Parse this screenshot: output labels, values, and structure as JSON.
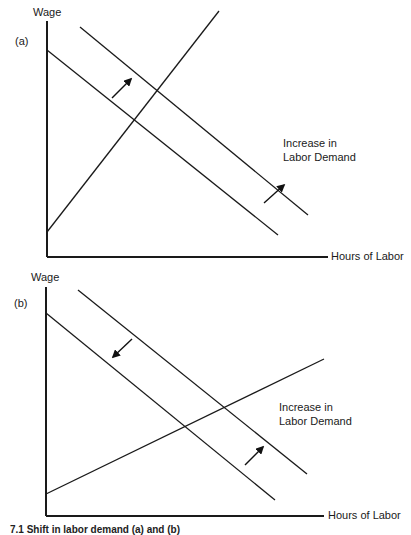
{
  "panels": [
    {
      "id": "a",
      "label": "(a)",
      "y_axis_label": "Wage",
      "x_axis_label": "Hours of Labor",
      "annotation": [
        "Increase in",
        "Labor Demand"
      ],
      "lines": {
        "y_axis": [
          47,
          21,
          47,
          257
        ],
        "x_axis": [
          47,
          257,
          328,
          257
        ],
        "demand_original": [
          47,
          50,
          278,
          235
        ],
        "demand_shifted": [
          80,
          27,
          308,
          215
        ],
        "supply": [
          47,
          232,
          219,
          11
        ]
      },
      "arrows": [
        {
          "from": [
            112,
            98
          ],
          "to": [
            131,
            79
          ],
          "direction": "up-right"
        },
        {
          "from": [
            264,
            203
          ],
          "to": [
            284,
            185
          ],
          "direction": "up-right"
        }
      ]
    },
    {
      "id": "b",
      "label": "(b)",
      "y_axis_label": "Wage",
      "x_axis_label": "Hours of Labor",
      "annotation": [
        "Increase in",
        "Labor Demand"
      ],
      "lines": {
        "y_axis": [
          46,
          287,
          46,
          516
        ],
        "x_axis": [
          46,
          516,
          324,
          516
        ],
        "demand_original": [
          46,
          313,
          275,
          500
        ],
        "demand_shifted": [
          78,
          290,
          307,
          474
        ],
        "supply": [
          46,
          494,
          324,
          359
        ]
      },
      "arrows": [
        {
          "from": [
            132,
            339
          ],
          "to": [
            113,
            357
          ],
          "direction": "down-left"
        },
        {
          "from": [
            245,
            465
          ],
          "to": [
            263,
            447
          ],
          "direction": "up-right"
        }
      ]
    }
  ],
  "caption": "7.1 Shift in labor demand (a) and (b)"
}
